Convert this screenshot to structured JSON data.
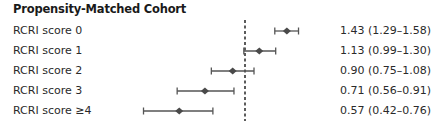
{
  "chart_data": {
    "type": "forest",
    "title": "Propensity-Matched Cohort",
    "scale": "log",
    "reference_line": 1.0,
    "xlabel": "",
    "ylabel": "",
    "grid": false,
    "legend": null,
    "categories": [
      "RCRI score 0",
      "RCRI score 1",
      "RCRI score 2",
      "RCRI score 3",
      "RCRI score ≥4"
    ],
    "series": [
      {
        "name": "Estimate (95% CI)",
        "points": [
          {
            "label": "RCRI score 0",
            "estimate": 1.43,
            "lower": 1.29,
            "upper": 1.58,
            "text": "1.43 (1.29–1.58)"
          },
          {
            "label": "RCRI score 1",
            "estimate": 1.13,
            "lower": 0.99,
            "upper": 1.3,
            "text": "1.13 (0.99–1.30)"
          },
          {
            "label": "RCRI score 2",
            "estimate": 0.9,
            "lower": 0.75,
            "upper": 1.08,
            "text": "0.90 (0.75–1.08)"
          },
          {
            "label": "RCRI score 3",
            "estimate": 0.71,
            "lower": 0.56,
            "upper": 0.91,
            "text": "0.71 (0.56–0.91)"
          },
          {
            "label": "RCRI score ≥4",
            "estimate": 0.57,
            "lower": 0.42,
            "upper": 0.76,
            "text": "0.57 (0.42–0.76)"
          }
        ]
      }
    ]
  },
  "header": {
    "title": "Propensity-Matched Cohort"
  },
  "rows": [
    {
      "label": "RCRI score 0",
      "value": "1.43 (1.29–1.58)"
    },
    {
      "label": "RCRI score 1",
      "value": "1.13 (0.99–1.30)"
    },
    {
      "label": "RCRI score 2",
      "value": "0.90 (0.75–1.08)"
    },
    {
      "label": "RCRI score 3",
      "value": "0.71 (0.56–0.91)"
    },
    {
      "label": "RCRI score ≥4",
      "value": "0.57 (0.42–0.76)"
    }
  ],
  "colors": {
    "marker": "#4a4a4a",
    "ci_line": "#555555",
    "reference": "#333333"
  }
}
